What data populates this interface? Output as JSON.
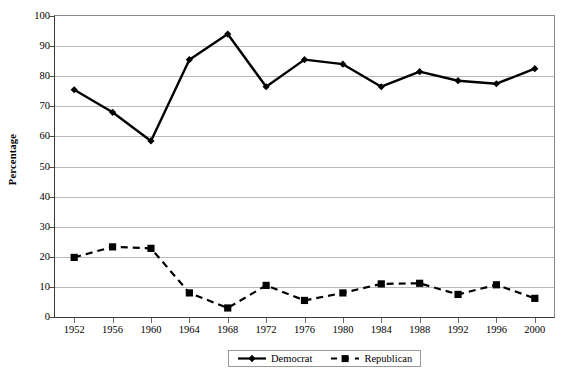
{
  "chart_data": {
    "type": "line",
    "title": "",
    "xlabel": "",
    "ylabel": "Percentage",
    "ylim": [
      0,
      100
    ],
    "ytick_step": 10,
    "yticks": [
      0,
      10,
      20,
      30,
      40,
      50,
      60,
      70,
      80,
      90,
      100
    ],
    "grid": true,
    "legend_position": "bottom",
    "categories": [
      "1952",
      "1956",
      "1960",
      "1964",
      "1968",
      "1972",
      "1976",
      "1980",
      "1984",
      "1988",
      "1992",
      "1996",
      "2000"
    ],
    "series": [
      {
        "name": "Democrat",
        "marker": "diamond",
        "line_style": "solid",
        "color": "#000000",
        "values": [
          75.5,
          68.0,
          58.5,
          85.5,
          94.0,
          76.5,
          85.5,
          84.0,
          76.5,
          81.5,
          78.5,
          77.5,
          82.5
        ]
      },
      {
        "name": "Republican",
        "marker": "square",
        "line_style": "dashed",
        "color": "#000000",
        "values": [
          19.8,
          23.3,
          22.8,
          8.0,
          3.0,
          10.5,
          5.5,
          8.0,
          11.0,
          11.2,
          7.5,
          10.7,
          6.2
        ]
      }
    ]
  },
  "axis": {
    "y_title": "Percentage",
    "y_tick_labels": [
      "100",
      "90",
      "80",
      "70",
      "60",
      "50",
      "40",
      "30",
      "20",
      "10",
      "0"
    ],
    "x_tick_labels": [
      "1952",
      "1956",
      "1960",
      "1964",
      "1968",
      "1972",
      "1976",
      "1980",
      "1984",
      "1988",
      "1992",
      "1996",
      "2000"
    ]
  },
  "legend": {
    "items": [
      {
        "label": "Democrat",
        "marker": "diamond-marker",
        "style": "solid"
      },
      {
        "label": "Republican",
        "marker": "square-marker",
        "style": "dashed"
      }
    ]
  }
}
